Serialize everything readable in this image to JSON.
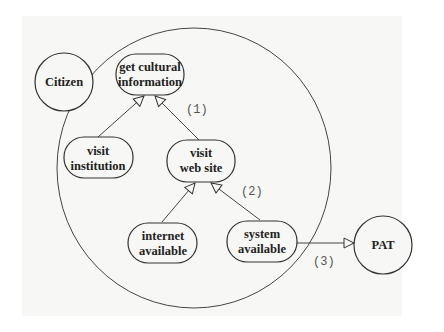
{
  "diagram": {
    "type": "goal-dependency diagram",
    "boundary": {
      "label": "",
      "shape": "circle"
    },
    "actors": [
      {
        "id": "citizen",
        "label": "Citizen"
      },
      {
        "id": "pat",
        "label": "PAT"
      }
    ],
    "goals": [
      {
        "id": "get_cultural_information",
        "line1": "get cultural",
        "line2": "information"
      },
      {
        "id": "visit_institution",
        "line1": "visit",
        "line2": "institution"
      },
      {
        "id": "visit_web_site",
        "line1": "visit",
        "line2": "web site"
      },
      {
        "id": "internet_available",
        "line1": "internet",
        "line2": "available"
      },
      {
        "id": "system_available",
        "line1": "system",
        "line2": "available"
      }
    ],
    "edges": [
      {
        "from": "visit_institution",
        "to": "get_cultural_information",
        "label": ""
      },
      {
        "from": "visit_web_site",
        "to": "get_cultural_information",
        "label": "(1)"
      },
      {
        "from": "internet_available",
        "to": "visit_web_site",
        "label": ""
      },
      {
        "from": "system_available",
        "to": "visit_web_site",
        "label": "(2)"
      },
      {
        "from": "system_available",
        "to": "pat",
        "label": "(3)"
      }
    ],
    "labels": {
      "e1": "(1)",
      "e2": "(2)",
      "e3": "(3)"
    }
  }
}
